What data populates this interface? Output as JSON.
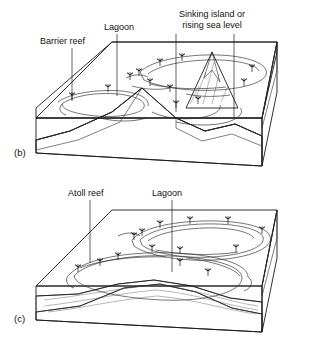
{
  "figure": {
    "background_color": "#ffffff",
    "ink_color": "#111111"
  },
  "palette": {
    "sea_surface": "#f2f2f0",
    "top_face_light": "#ededeb",
    "front_face": "#e8e8e6",
    "right_face_dark": "#5a5a5a",
    "right_face_mid": "#7e7e7e",
    "volcano_core": "#8c8c8c",
    "volcano_flank": "#d8d8d6",
    "reef_fill": "#cfcfcd",
    "lagoon_fill": "#fbfbfa",
    "outline": "#1a1a1a"
  },
  "panels": [
    {
      "id": "panel-b",
      "letter": "(b)",
      "stage_name": "Barrier reef stage",
      "description": "Block diagram of a subsiding volcanic island ringed by a barrier reef enclosing a lagoon. A cutaway front face shows the volcanic cone in cross-section.",
      "labels": [
        {
          "id": "barrier-reef",
          "text": "Barrier reef",
          "lines": [
            "Barrier reef"
          ],
          "text_x": 40,
          "text_y": 40,
          "anchor": "start",
          "leader": {
            "x1": 72,
            "y1": 44,
            "x2": 72,
            "y2": 101
          }
        },
        {
          "id": "lagoon",
          "text": "Lagoon",
          "lines": [
            "Lagoon"
          ],
          "text_x": 104,
          "text_y": 26,
          "anchor": "start",
          "leader": {
            "x1": 117,
            "y1": 30,
            "x2": 117,
            "y2": 96
          }
        },
        {
          "id": "sinking-island",
          "text": "Sinking island or rising sea level",
          "lines": [
            "Sinking island or",
            "rising sea level"
          ],
          "text_x": 212,
          "text_y": 17,
          "anchor": "middle",
          "leader": {
            "x1": 176,
            "y1": 40,
            "x2": 176,
            "y2": 112
          },
          "leader2": {
            "x1": 234,
            "y1": 40,
            "x2": 234,
            "y2": 117
          }
        }
      ],
      "features": {
        "island_present": true,
        "island_label": "volcanic island peak",
        "reef_ring_label": "barrier reef ring",
        "lagoon_label": "lagoon between island and reef",
        "palm_tree_count": 12
      }
    },
    {
      "id": "panel-c",
      "letter": "(c)",
      "stage_name": "Atoll stage",
      "description": "Block diagram after the volcanic island has subsided completely below sea level, leaving a ring-shaped atoll reef enclosing a central lagoon. The cutaway shows the drowned volcano capped by reef material.",
      "labels": [
        {
          "id": "atoll-reef",
          "text": "Atoll reef",
          "lines": [
            "Atoll reef"
          ],
          "text_x": 68,
          "text_y": 192,
          "anchor": "start",
          "leader": {
            "x1": 90,
            "y1": 196,
            "x2": 90,
            "y2": 263
          }
        },
        {
          "id": "lagoon",
          "text": "Lagoon",
          "lines": [
            "Lagoon"
          ],
          "text_x": 152,
          "text_y": 192,
          "anchor": "start",
          "leader": {
            "x1": 172,
            "y1": 196,
            "x2": 172,
            "y2": 272
          }
        }
      ],
      "features": {
        "island_present": false,
        "reef_ring_label": "atoll reef ring",
        "lagoon_label": "central lagoon",
        "palm_tree_count": 14
      }
    }
  ]
}
